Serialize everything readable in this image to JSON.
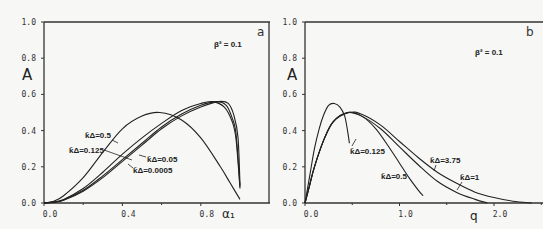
{
  "chart_data": [
    {
      "type": "line",
      "panel": "a",
      "title": "",
      "annotation": "β² = 0.1",
      "xlabel": "α₁",
      "ylabel": "A",
      "xlim": [
        0.0,
        1.0
      ],
      "ylim": [
        0.0,
        1.0
      ],
      "xticks": [
        0.0,
        0.4,
        0.8
      ],
      "xtick_labels": [
        "0.0",
        "0.4",
        "0.8"
      ],
      "yticks": [
        0.0,
        0.2,
        0.4,
        0.6,
        0.8,
        1.0
      ],
      "ytick_labels": [
        "0.0",
        "0.2",
        "0.4",
        "0.6",
        "0.8",
        "1.0"
      ],
      "grid": false,
      "series": [
        {
          "name": "k̃Δ=0.5",
          "x": [
            0.0,
            0.05,
            0.1,
            0.2,
            0.3,
            0.4,
            0.5,
            0.59,
            0.7,
            0.8,
            0.9,
            0.95,
            1.0
          ],
          "y": [
            0.0,
            0.01,
            0.04,
            0.14,
            0.28,
            0.41,
            0.48,
            0.5,
            0.46,
            0.36,
            0.2,
            0.11,
            0.02
          ]
        },
        {
          "name": "k̃Δ=0.125",
          "x": [
            0.0,
            0.05,
            0.1,
            0.2,
            0.3,
            0.4,
            0.5,
            0.6,
            0.7,
            0.8,
            0.86,
            0.92,
            0.96,
            0.98,
            1.0
          ],
          "y": [
            0.0,
            0.006,
            0.02,
            0.08,
            0.17,
            0.27,
            0.36,
            0.44,
            0.51,
            0.55,
            0.56,
            0.53,
            0.45,
            0.35,
            0.08
          ]
        },
        {
          "name": "k̃Δ=0.05",
          "x": [
            0.0,
            0.05,
            0.1,
            0.2,
            0.3,
            0.4,
            0.5,
            0.6,
            0.7,
            0.8,
            0.88,
            0.93,
            0.96,
            0.98,
            1.0
          ],
          "y": [
            0.0,
            0.005,
            0.017,
            0.07,
            0.15,
            0.24,
            0.33,
            0.42,
            0.49,
            0.54,
            0.56,
            0.54,
            0.47,
            0.38,
            0.09
          ]
        },
        {
          "name": "k̃Δ=0.0005",
          "x": [
            0.0,
            0.05,
            0.1,
            0.2,
            0.3,
            0.4,
            0.5,
            0.6,
            0.7,
            0.8,
            0.89,
            0.94,
            0.97,
            0.99,
            1.0
          ],
          "y": [
            0.0,
            0.004,
            0.015,
            0.065,
            0.14,
            0.23,
            0.32,
            0.41,
            0.48,
            0.53,
            0.56,
            0.55,
            0.48,
            0.36,
            0.1
          ]
        }
      ]
    },
    {
      "type": "line",
      "panel": "b",
      "title": "",
      "annotation": "β² = 0.1",
      "xlabel": "q",
      "ylabel": "A",
      "xlim": [
        0.0,
        2.6
      ],
      "ylim": [
        0.0,
        1.0
      ],
      "xticks": [
        0.0,
        1.0,
        2.0
      ],
      "xtick_labels": [
        "0.0",
        "1.0",
        "2.0"
      ],
      "yticks": [
        0.0,
        0.2,
        0.4,
        0.6,
        0.8,
        1.0
      ],
      "ytick_labels": [
        "0.0",
        "0.2",
        "0.4",
        "0.6",
        "0.8",
        "1.0"
      ],
      "grid": false,
      "series": [
        {
          "name": "k̃Δ=0.125",
          "x": [
            0.0,
            0.05,
            0.1,
            0.15,
            0.2,
            0.25,
            0.31,
            0.37,
            0.42,
            0.45,
            0.47
          ],
          "y": [
            0.0,
            0.15,
            0.3,
            0.41,
            0.49,
            0.54,
            0.55,
            0.53,
            0.48,
            0.4,
            0.33
          ]
        },
        {
          "name": "k̃Δ=0.5",
          "x": [
            0.0,
            0.05,
            0.1,
            0.2,
            0.3,
            0.45,
            0.6,
            0.75,
            0.9,
            1.0,
            1.1,
            1.2,
            1.25
          ],
          "y": [
            0.0,
            0.1,
            0.2,
            0.35,
            0.45,
            0.5,
            0.48,
            0.41,
            0.3,
            0.22,
            0.14,
            0.07,
            0.04
          ]
        },
        {
          "name": "k̃Δ=1",
          "x": [
            0.0,
            0.05,
            0.1,
            0.2,
            0.3,
            0.45,
            0.6,
            0.8,
            1.0,
            1.2,
            1.4,
            1.6,
            1.8,
            1.93
          ],
          "y": [
            0.0,
            0.1,
            0.2,
            0.35,
            0.45,
            0.5,
            0.48,
            0.41,
            0.31,
            0.21,
            0.12,
            0.06,
            0.02,
            0.0
          ]
        },
        {
          "name": "k̃Δ=3.75",
          "x": [
            0.0,
            0.05,
            0.1,
            0.2,
            0.3,
            0.47,
            0.6,
            0.8,
            1.0,
            1.2,
            1.4,
            1.6,
            1.8,
            2.0,
            2.2,
            2.4
          ],
          "y": [
            0.0,
            0.1,
            0.2,
            0.35,
            0.45,
            0.5,
            0.49,
            0.43,
            0.34,
            0.25,
            0.17,
            0.11,
            0.06,
            0.03,
            0.01,
            0.0
          ]
        }
      ]
    }
  ],
  "panels": {
    "a": {
      "letter": "a",
      "beta": "β² = 0.1",
      "ylabel": "A",
      "xlabel": "α₁",
      "labels": [
        "k̃Δ=0.5",
        "k̃Δ=0.125",
        "k̃Δ=0.05",
        "k̃Δ=0.0005"
      ]
    },
    "b": {
      "letter": "b",
      "beta": "β² = 0.1",
      "ylabel": "A",
      "xlabel": "q",
      "labels": [
        "k̃Δ=0.125",
        "k̃Δ=0.5",
        "k̃Δ=3.75",
        "k̃Δ=1"
      ]
    }
  }
}
